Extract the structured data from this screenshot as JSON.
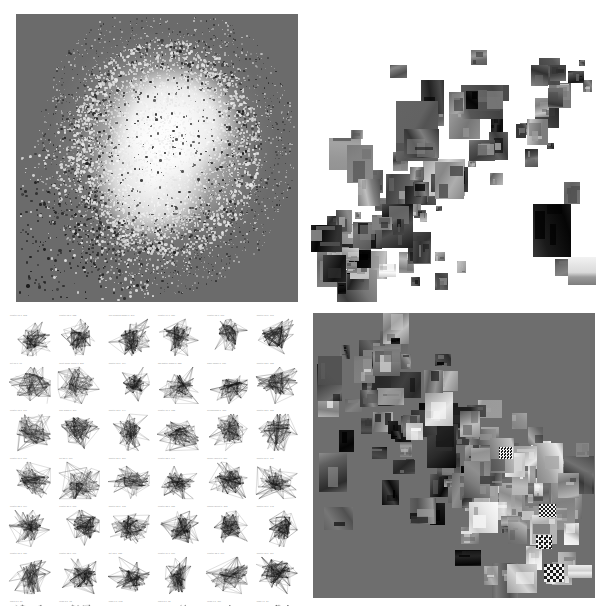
{
  "figure": {
    "title": "",
    "layout": "2x2 panel grid of visualization results",
    "width": 607,
    "height": 611,
    "background_color": "#ffffff"
  },
  "panels": [
    {
      "id": "panel-a",
      "position": "top-left",
      "name": "dense-point-cloud-embedding",
      "plot_type": "scatter",
      "background_color": "#6b6b6b",
      "point_colors": [
        "#ffffff",
        "#f2f2f2",
        "#1a1a1a"
      ],
      "description": "Dense scatter embedding; bright saturated core with dark outlier points along lower-left fringe",
      "bounds": {
        "x": 16,
        "y": 14,
        "w": 282,
        "h": 288
      }
    },
    {
      "id": "panel-b",
      "position": "top-right",
      "name": "image-thumbnail-scatter-white",
      "plot_type": "scatter",
      "background_color": "#ffffff",
      "description": "Grayscale image thumbnails placed at 2D embedding coordinates, diagonal cluster from lower-left to upper-right",
      "bounds": {
        "x": 311,
        "y": 14,
        "w": 290,
        "h": 288
      }
    },
    {
      "id": "panel-c",
      "position": "bottom-left",
      "name": "small-multiples-graph-grid",
      "plot_type": "scatter",
      "background_color": "#ffffff",
      "grid_columns": 6,
      "grid_rows": 6,
      "description": "Grid of small multiple graph-layout drawings, each with a tiny caption above",
      "bounds": {
        "x": 8,
        "y": 310,
        "w": 296,
        "h": 296
      }
    },
    {
      "id": "panel-d",
      "position": "bottom-right",
      "name": "image-thumbnail-scatter-gray",
      "plot_type": "scatter",
      "background_color": "#6e6e6e",
      "description": "Grayscale image thumbnails on gray canvas forming a broad diagonal band",
      "bounds": {
        "x": 313,
        "y": 313,
        "w": 282,
        "h": 285
      }
    }
  ],
  "chart_data": [
    {
      "type": "scatter",
      "panel": "panel-a",
      "title": "",
      "xlabel": "",
      "ylabel": "",
      "xlim": [
        0,
        1
      ],
      "ylim": [
        0,
        1
      ],
      "grid": false,
      "legend": null,
      "n_points": 9000,
      "series": [
        {
          "name": "bright-points",
          "color": "#ffffff",
          "count": 8400
        },
        {
          "name": "dark-points",
          "color": "#141414",
          "count": 600
        }
      ],
      "notes": "Density peaks near (0.53,0.55) normalized; tail extends toward lower-left corner"
    },
    {
      "type": "scatter",
      "panel": "panel-b",
      "title": "",
      "xlabel": "",
      "ylabel": "",
      "xlim": [
        0,
        1
      ],
      "ylim": [
        0,
        1
      ],
      "grid": false,
      "legend": null,
      "n_points": 92,
      "marker": "image-thumbnail",
      "notes": "Thumbnails sized 6-42px, densest cluster at lower-left third"
    },
    {
      "type": "scatter",
      "panel": "panel-c",
      "title": "",
      "xlabel": "",
      "ylabel": "",
      "xlim": [
        0,
        1
      ],
      "ylim": [
        0,
        1
      ],
      "grid": true,
      "legend": null,
      "subplot_rows": 6,
      "subplot_cols": 6,
      "notes": "Each subplot is a node-link layout rendered as dense line scribble with faint caption"
    },
    {
      "type": "scatter",
      "panel": "panel-d",
      "title": "",
      "xlabel": "",
      "ylabel": "",
      "xlim": [
        0,
        1
      ],
      "ylim": [
        0,
        1
      ],
      "grid": false,
      "legend": null,
      "n_points": 118,
      "marker": "image-thumbnail",
      "notes": "Thumbnails sized 8-30px distributed along a diagonal band"
    }
  ],
  "captions": {
    "cell_titles": [
      "cluster 01  n=212",
      "cluster 02  n=188",
      "fine grained model  n=240",
      "cluster 04  n=150",
      "cluster 05  n=197",
      "cluster 06  n=163",
      "set 07  n=91",
      "multi scale group  n=205",
      "cluster 09  n=174",
      "adj matrix graph  n=228",
      "base model  n=139",
      "cluster 12  n=182",
      "cluster 13  n=166",
      "knn graph  n=201",
      "cluster 15  n=144",
      "cluster 16  n=122",
      "hierarchical  n=233",
      "cluster 18  n=158",
      "cluster 19  n=176",
      "set 20  n=119",
      "cluster 21  n=209",
      "cluster 22  n=147",
      "dense layout  n=251",
      "cluster 24  n=131",
      "cluster 25  n=104",
      "cluster 26  n=193",
      "cluster 27  n=168",
      "cluster 28  n=155",
      "spring layout  n=218",
      "cluster 30  n=142",
      "cluster 31  n=186",
      "cluster 32  n=171",
      "set 33  n=128",
      "cluster 34  n=199",
      "cluster 35  n=160",
      "cluster 36  n=113",
      "row7 a  n=87",
      "row7 b  n=95",
      "row7 c  n=102",
      "row7 d  n=78",
      "row7 e  n=110",
      "row7 f  n=84"
    ]
  }
}
